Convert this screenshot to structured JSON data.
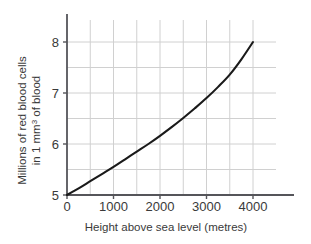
{
  "chart_data": {
    "type": "line",
    "title": "",
    "xlabel": "Height above sea level (metres)",
    "ylabel_line1": "Millions of red blood cells",
    "ylabel_line2": "in 1 mm3 of blood",
    "ylabel_full": "Millions of red blood cells in 1 mm3 of blood",
    "xlim": [
      0,
      4000
    ],
    "ylim": [
      5,
      8
    ],
    "xticks": [
      0,
      1000,
      2000,
      3000,
      4000
    ],
    "xtick_labels": [
      "0",
      "1000",
      "2000",
      "3000",
      "4000"
    ],
    "yticks": [
      5,
      6,
      7,
      8
    ],
    "ytick_labels": [
      "5",
      "6",
      "7",
      "8"
    ],
    "x_gridline_step": 500,
    "y_gridline_step": 0.5,
    "grid": true,
    "legend": "none",
    "line_color": "#1a1a1a",
    "grid_color": "#d0d0d0",
    "axis_color": "#55555a",
    "x": [
      0,
      250,
      500,
      750,
      1000,
      1250,
      1500,
      1750,
      2000,
      2250,
      2500,
      2750,
      3000,
      3250,
      3500,
      3750,
      4000
    ],
    "y": [
      5.0,
      5.13,
      5.27,
      5.41,
      5.55,
      5.7,
      5.85,
      6.0,
      6.16,
      6.33,
      6.51,
      6.7,
      6.9,
      7.12,
      7.36,
      7.66,
      8.0
    ],
    "annotations": []
  }
}
